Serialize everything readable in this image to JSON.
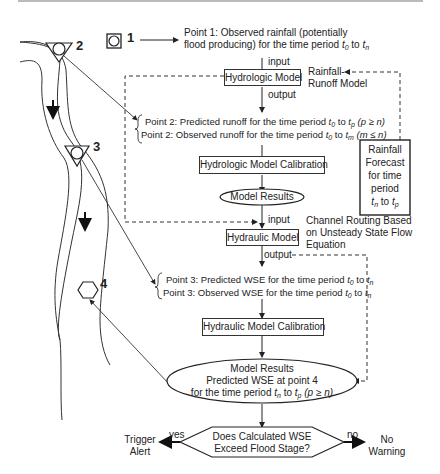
{
  "points": {
    "p1": "1",
    "p2": "2",
    "p3": "3",
    "p4": "4"
  },
  "point1_text": {
    "line1": "Point 1: Observed rainfall (potentially",
    "line2_prefix": "flood producing) for the time period ",
    "t_from": "t",
    "t_from_sub": "0",
    "to": " to ",
    "t_to": "t",
    "t_to_sub": "n"
  },
  "hydrologic": {
    "input_label": "input",
    "model_label": "Hydrologic Model",
    "output_label": "output",
    "side_label_1": "Rainfall-",
    "side_label_2": "Runoff Model"
  },
  "point2_text": {
    "predicted": "Point 2: Predicted runoff for the time period t0 to tp (p ≥ n)",
    "predicted_prefix": "Point 2: Predicted runoff for the time period ",
    "predicted_cond": " (p ≥ n)",
    "observed_prefix": "Point 2: Observed runoff for the time period ",
    "observed_cond": " (m ≤ n)",
    "t0": "t",
    "t0_sub": "0",
    "tp": "t",
    "tp_sub": "p",
    "tm": "t",
    "tm_sub": "m",
    "to": " to "
  },
  "hydrologic_calibration": "Hydrologic Model Calibration",
  "model_results_1": "Model Results",
  "rainfall_forecast": {
    "line1": "Rainfall",
    "line2": "Forecast",
    "line3": "for time",
    "line4": "period",
    "t_from": "t",
    "t_from_sub": "n",
    "to": " to ",
    "t_to": "t",
    "t_to_sub": "p"
  },
  "hydraulic": {
    "input_label": "input",
    "model_label": "Hydraulic Model",
    "output_label": "output",
    "side_label_1": "Channel Routing Based",
    "side_label_2": "on Unsteady State Flow",
    "side_label_3": "Equation"
  },
  "point3_text": {
    "predicted_prefix": "Point 3: Predicted WSE for the time period ",
    "observed_prefix": "Point 3: Observed WSE for the time period ",
    "t0": "t",
    "t0_sub": "0",
    "tn": "t",
    "tn_sub": "n",
    "to": " to "
  },
  "hydraulic_calibration": "Hydraulic Model Calibration",
  "model_results_2": {
    "line1": "Model Results",
    "line2": "Predicted WSE at point 4",
    "line3_prefix": "for the time period ",
    "tn": "t",
    "tn_sub": "n",
    "to": " to ",
    "tp": "t",
    "tp_sub": "p",
    "cond": " (p ≥ n)"
  },
  "decision": {
    "line1": "Does Calculated WSE",
    "line2": "Exceed Flood Stage?",
    "yes_label": "yes",
    "no_label": "no",
    "yes_outcome_1": "Trigger",
    "yes_outcome_2": "Alert",
    "no_outcome_1": "No",
    "no_outcome_2": "Warning"
  }
}
